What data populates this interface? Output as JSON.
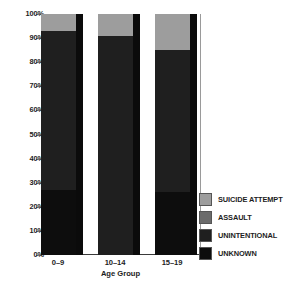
{
  "chart_data": {
    "type": "bar",
    "stacked": true,
    "normalized_percent": true,
    "title": "",
    "xlabel": "Age Group",
    "ylabel": "",
    "categories": [
      "0–9",
      "10–14",
      "15–19"
    ],
    "ylim": [
      0,
      100
    ],
    "ytick_labels": [
      "0%",
      "10%",
      "20%",
      "30%",
      "40%",
      "50%",
      "60%",
      "70%",
      "80%",
      "90%",
      "100%"
    ],
    "ytick_values": [
      0,
      10,
      20,
      30,
      40,
      50,
      60,
      70,
      80,
      90,
      100
    ],
    "grid": true,
    "legend_position": "right",
    "series": [
      {
        "name": "SUICIDE ATTEMPT",
        "color": "#9d9d9d",
        "values": [
          7,
          9,
          15
        ]
      },
      {
        "name": "ASSAULT",
        "color": "#6b6b6b",
        "values": [
          0,
          0,
          0
        ]
      },
      {
        "name": "UNINTENTIONAL",
        "color": "#1f1f1f",
        "values": [
          66,
          91,
          59
        ]
      },
      {
        "name": "UNKNOWN",
        "color": "#0d0d0d",
        "values": [
          27,
          0,
          26
        ]
      }
    ]
  },
  "legend": {
    "items": [
      {
        "label": "SUICIDE ATTEMPT",
        "color": "#9d9d9d"
      },
      {
        "label": "ASSAULT",
        "color": "#6b6b6b"
      },
      {
        "label": "UNINTENTIONAL",
        "color": "#1f1f1f"
      },
      {
        "label": "UNKNOWN",
        "color": "#0d0d0d"
      }
    ]
  },
  "axis": {
    "x_title": "Age Group"
  }
}
